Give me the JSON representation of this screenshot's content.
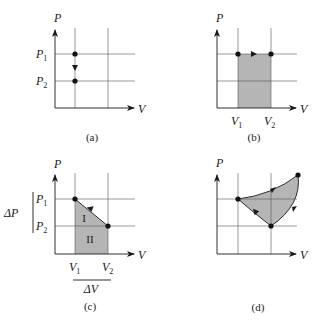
{
  "figure": {
    "colors": {
      "line": "#1a1a1a",
      "grid": "#555555",
      "fill": "#b5b5b5",
      "dot": "#111111"
    },
    "panels": [
      {
        "id": "a",
        "caption": "(a)",
        "y_axis_label": "P",
        "x_axis_label": "V",
        "y_ticks": [
          {
            "main": "P",
            "sub": "1"
          },
          {
            "main": "P",
            "sub": "2"
          }
        ],
        "x_ticks": [],
        "process": "isochoric pressure drop from P1 to P2"
      },
      {
        "id": "b",
        "caption": "(b)",
        "y_axis_label": "P",
        "x_axis_label": "V",
        "y_ticks": [],
        "x_ticks": [
          {
            "main": "V",
            "sub": "1"
          },
          {
            "main": "V",
            "sub": "2"
          }
        ],
        "process": "isobaric expansion from V1 to V2, shaded work area"
      },
      {
        "id": "c",
        "caption": "(c)",
        "y_axis_label": "P",
        "x_axis_label": "V",
        "y_ticks": [
          {
            "main": "P",
            "sub": "1"
          },
          {
            "main": "P",
            "sub": "2"
          }
        ],
        "x_ticks": [
          {
            "main": "V",
            "sub": "1"
          },
          {
            "main": "V",
            "sub": "2"
          }
        ],
        "delta_p": "ΔP",
        "delta_v": "ΔV",
        "region_labels": [
          "I",
          "II"
        ],
        "process": "linear process from (V1,P1) to (V2,P2), area split into triangle I and rectangle II"
      },
      {
        "id": "d",
        "caption": "(d)",
        "y_axis_label": "P",
        "x_axis_label": "V",
        "y_ticks": [],
        "x_ticks": [],
        "process": "closed cyclic process, shaded enclosed area"
      }
    ]
  }
}
